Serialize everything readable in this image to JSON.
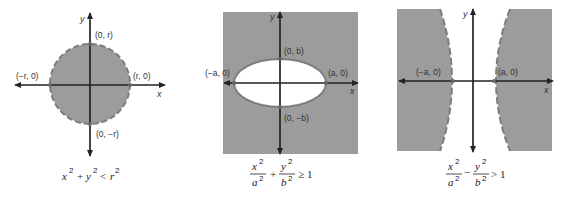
{
  "colors": {
    "shade": "#9c9c9c",
    "boundary": "#7d7d7d",
    "axis": "#222222",
    "background": "#ffffff",
    "text": "#333333"
  },
  "panels": [
    {
      "id": "circle",
      "description": "Interior of circle shaded, dashed boundary (strict inequality)",
      "axis_labels": {
        "x": "x",
        "y": "y"
      },
      "points": {
        "top": "(0, r)",
        "bottom": "(0, −r)",
        "left": "(−r, 0)",
        "right": "(r, 0)"
      },
      "inequality": {
        "lhs_a": "x",
        "lhs_b": "y",
        "rel": "<",
        "rhs": "r",
        "exp": "2",
        "op": "+"
      },
      "boundary_style": "dashed",
      "shaded_region": "inside"
    },
    {
      "id": "ellipse",
      "description": "Exterior of ellipse shaded, solid boundary (non-strict inequality)",
      "axis_labels": {
        "x": "x",
        "y": "y"
      },
      "points": {
        "top": "(0, b)",
        "bottom": "(0, −b)",
        "left": "(−a, 0)",
        "right": "(a, 0)"
      },
      "inequality": {
        "num1": "x",
        "den1": "a",
        "num2": "y",
        "den2": "b",
        "op": "+",
        "rel": "≥",
        "rhs": "1",
        "exp": "2"
      },
      "boundary_style": "solid",
      "shaded_region": "outside"
    },
    {
      "id": "hyperbola",
      "description": "Region beyond hyperbola branches shaded, dashed boundary (strict inequality)",
      "axis_labels": {
        "x": "x",
        "y": "y"
      },
      "points": {
        "left": "(−a, 0)",
        "right": "(a, 0)"
      },
      "inequality": {
        "num1": "x",
        "den1": "a",
        "num2": "y",
        "den2": "b",
        "op": "−",
        "rel": ">",
        "rhs": "1",
        "exp": "2"
      },
      "boundary_style": "dashed",
      "shaded_region": "outside-branches"
    }
  ]
}
